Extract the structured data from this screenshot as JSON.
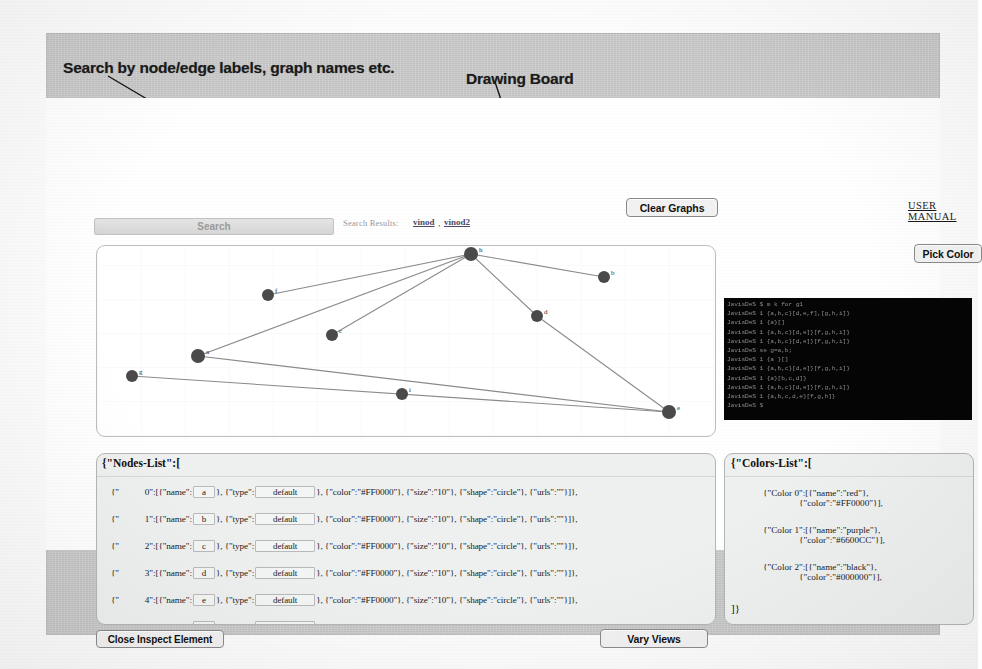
{
  "annotations": {
    "search": "Search by node/edge labels, graph names etc.",
    "drawing_board": "Drawing Board",
    "command_shell": "Command Shell",
    "graph_markup_language": "Graph Markup Language",
    "layout_assistance": "Layout Assistance",
    "graph_style_sheet": "Graph Style Sheet"
  },
  "toolbar": {
    "clear_graphs": "Clear Graphs",
    "user_manual": "USER MANUAL",
    "pick_color": "Pick Color",
    "close_inspect_element": "Close Inspect Element",
    "vary_views": "Vary Views"
  },
  "search": {
    "placeholder": "Search",
    "value": "Search",
    "results_label": "Search Results:",
    "separator": ",",
    "results": [
      {
        "label": "vinod"
      },
      {
        "label": "vinod2"
      }
    ]
  },
  "command_shell": {
    "lines": [
      "JavisDeS $ m k for g1",
      "JavisDeS 1 {a,b,c}[d,e,f],[g,h,i]}",
      "JavisDeS 1 {a}[]",
      "JavisDeS 1 {a,b,c}[d,e]}[f,g,h,i]}",
      "JavisDeS 1 {a,b,c}[d,e]}[f,g,h,i]}",
      "JavisDeS se  g=a,b;",
      "JavisDeS 1 {a }[]",
      "JavisDeS 1 {a,b,c}[d,e]}[f,g,h,i]}",
      "JavisDeS 1 {a}[b,c,d]}",
      "JavisDeS 1 {a,b,c}[d,e]}[f,g,h,i]}",
      "JavisDeS 1 {a,b,c,d,e}[f,g,h]}",
      "JavisDeS $"
    ]
  },
  "nodes_panel": {
    "title": "{\"Nodes-List\":[",
    "rows": [
      {
        "prefix": "{\"",
        "index": "0\"",
        "mid": ":[{\"name\":",
        "name": "a",
        "mid2": "}, {\"type\":",
        "type": "default",
        "tail": "}, {\"color\":\"#FF0000\"}, {\"size\":\"10\"}, {\"shape\":\"circle\"}, {\"urls\":\"\"}]},"
      },
      {
        "prefix": "{\"",
        "index": "1\"",
        "mid": ":[{\"name\":",
        "name": "b",
        "mid2": "}, {\"type\":",
        "type": "default",
        "tail": "}, {\"color\":\"#FF0000\"}, {\"size\":\"10\"}, {\"shape\":\"circle\"}, {\"urls\":\"\"}]},"
      },
      {
        "prefix": "{\"",
        "index": "2\"",
        "mid": ":[{\"name\":",
        "name": "c",
        "mid2": "}, {\"type\":",
        "type": "default",
        "tail": "}, {\"color\":\"#FF0000\"}, {\"size\":\"10\"}, {\"shape\":\"circle\"}, {\"urls\":\"\"}]},"
      },
      {
        "prefix": "{\"",
        "index": "3\"",
        "mid": ":[{\"name\":",
        "name": "d",
        "mid2": "}, {\"type\":",
        "type": "default",
        "tail": "}, {\"color\":\"#FF0000\"}, {\"size\":\"10\"}, {\"shape\":\"circle\"}, {\"urls\":\"\"}]},"
      },
      {
        "prefix": "{\"",
        "index": "4\"",
        "mid": ":[{\"name\":",
        "name": "e",
        "mid2": "}, {\"type\":",
        "type": "default",
        "tail": "}, {\"color\":\"#FF0000\"}, {\"size\":\"10\"}, {\"shape\":\"circle\"}, {\"urls\":\"\"}]},"
      },
      {
        "prefix": "{\"",
        "index": "5\"",
        "mid": ":[{\"name\":",
        "name": "f",
        "mid2": "}, {\"type\":",
        "type": "default",
        "tail": "}, {\"color\":\"#FF0000\"}, {\"size\":\"10\"}, {\"shape\":\"circle\"}, {\"urls\":\"\"}]},"
      }
    ]
  },
  "colors_panel": {
    "title": "{\"Colors-List\":[",
    "closing": "]}",
    "colors": [
      {
        "line1": "{\"Color 0\":[{\"name\":\"red\"},",
        "line2": "{\"color\":\"#FF0000\"}],",
        "name": "red",
        "hex": "#FF0000"
      },
      {
        "line1": "{\"Color 1\":[{\"name\":\"purple\"},",
        "line2": "{\"color\":\"#6600CC\"}],",
        "name": "purple",
        "hex": "#6600CC"
      },
      {
        "line1": "{\"Color 2\":[{\"name\":\"black\"},",
        "line2": "{\"color\":\"#000000\"}],",
        "name": "black",
        "hex": "#000000"
      }
    ]
  },
  "graph": {
    "node_color": "#4a4a4a",
    "edge_color": "#8a8a8a",
    "nodes": [
      {
        "id": "h",
        "label": "h",
        "x": 424,
        "y": 155,
        "r": 7
      },
      {
        "id": "b",
        "label": "b",
        "x": 557,
        "y": 178,
        "r": 6
      },
      {
        "id": "f",
        "label": "f",
        "x": 221,
        "y": 196,
        "r": 6
      },
      {
        "id": "d",
        "label": "d",
        "x": 490,
        "y": 217,
        "r": 6
      },
      {
        "id": "c",
        "label": "c",
        "x": 285,
        "y": 236,
        "r": 6
      },
      {
        "id": "a",
        "label": "a",
        "x": 151,
        "y": 257,
        "r": 7
      },
      {
        "id": "g",
        "label": "g",
        "x": 85,
        "y": 277,
        "r": 6
      },
      {
        "id": "i",
        "label": "i",
        "x": 355,
        "y": 295,
        "r": 6
      },
      {
        "id": "e",
        "label": "e",
        "x": 622,
        "y": 313,
        "r": 7
      }
    ],
    "edges": [
      {
        "from": "h",
        "to": "f"
      },
      {
        "from": "h",
        "to": "b"
      },
      {
        "from": "h",
        "to": "c"
      },
      {
        "from": "h",
        "to": "a"
      },
      {
        "from": "h",
        "to": "d"
      },
      {
        "from": "d",
        "to": "e"
      },
      {
        "from": "a",
        "to": "e"
      },
      {
        "from": "g",
        "to": "e"
      }
    ]
  }
}
